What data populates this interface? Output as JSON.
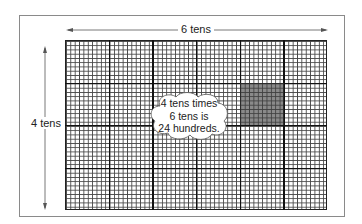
{
  "diagram": {
    "top_label": "6 tens",
    "side_label": "4 tens",
    "cloud_lines": [
      "4 tens times",
      "6 tens is",
      "24 hundreds."
    ],
    "grid": {
      "columns_tens": 6,
      "rows_tens": 4,
      "small_cells_per_ten": 10
    },
    "shaded_block": {
      "column": 5,
      "row": 2
    },
    "colors": {
      "grid_line": "#444444",
      "major_line": "#111111",
      "shade": "#5a5a5a",
      "frame": "#8a8a8a"
    }
  }
}
